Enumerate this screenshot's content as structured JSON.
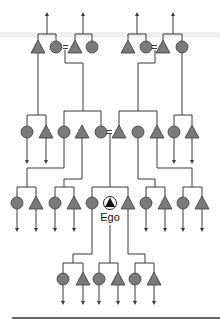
{
  "diagram": {
    "type": "kinship-chart",
    "ego_label": "Ego",
    "legend": {
      "triangle": "male",
      "circle": "female",
      "equals": "marriage",
      "arrow": "line continues"
    },
    "colors": {
      "symbol_fill": "#7a7a7a",
      "line": "#3a3a3a",
      "background": "#ffffff"
    },
    "generations": [
      {
        "level": "G+2",
        "members": [
          "male",
          "female",
          "=",
          "male",
          "female",
          "male",
          "female",
          "=",
          "male",
          "female"
        ]
      },
      {
        "level": "G+1",
        "members": [
          "female",
          "male",
          "female",
          "male",
          "female",
          "=",
          "male",
          "female",
          "male",
          "female",
          "male"
        ]
      },
      {
        "level": "G0",
        "members": [
          "female",
          "male",
          "female",
          "male",
          "female",
          "ego",
          "male",
          "female",
          "male",
          "female",
          "male"
        ]
      },
      {
        "level": "G-1",
        "members": [
          "female",
          "male",
          "female",
          "male",
          "female",
          "male"
        ]
      }
    ]
  }
}
